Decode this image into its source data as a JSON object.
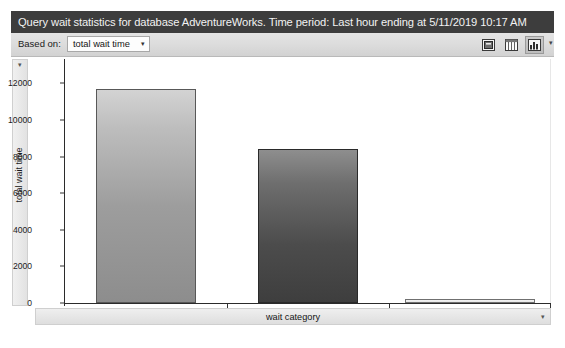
{
  "titlebar": {
    "text": "Query wait statistics for database AdventureWorks. Time period: Last hour ending at 5/11/2019 10:17 AM"
  },
  "toolbar": {
    "based_on_label": "Based on:",
    "based_on_value": "total wait time",
    "dropdown_caret": "▾",
    "overflow_caret": "▾",
    "buttons": [
      {
        "name": "export-button",
        "tooltip": "Export",
        "pressed": false
      },
      {
        "name": "grid-view-button",
        "tooltip": "Grid view",
        "pressed": false
      },
      {
        "name": "chart-view-button",
        "tooltip": "Chart view",
        "pressed": true
      }
    ]
  },
  "axis_panels": {
    "y_title": "total wait time",
    "y_caret": "▾",
    "x_title": "wait category",
    "x_caret": "▾"
  },
  "chart_data": {
    "type": "bar",
    "title": "",
    "categories": [
      "CPU",
      "Buffer Latch",
      "Memory"
    ],
    "values": [
      11700,
      8400,
      100
    ],
    "series": [
      {
        "name": "total wait time",
        "values": [
          11700,
          8400,
          100
        ]
      }
    ],
    "xlabel": "wait category",
    "ylabel": "total wait time",
    "ylim": [
      0,
      13000
    ],
    "yticks": [
      0,
      2000,
      4000,
      6000,
      8000,
      10000,
      12000
    ],
    "ytick_labels": [
      "0",
      "2000",
      "4000",
      "6000",
      "8000",
      "10000",
      "12000"
    ],
    "grid": false,
    "legend": false,
    "orientation": "vertical",
    "bar_styles": [
      "light",
      "dark",
      "flat"
    ]
  }
}
